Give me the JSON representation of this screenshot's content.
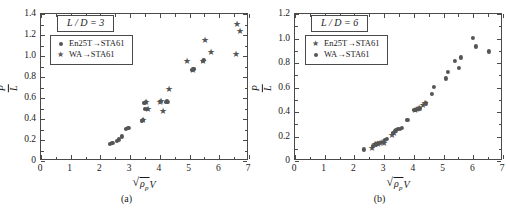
{
  "figure": {
    "panels": [
      {
        "id": "a",
        "caption": "(a)",
        "title": "L / D = 3",
        "legend": [
          {
            "marker": "circle",
            "label": "En25T→STA61"
          },
          {
            "marker": "star",
            "label": "WA→STA61"
          }
        ],
        "axes": {
          "xlabel_parts": {
            "radical": "ρ",
            "sub": "p",
            "trailing": "V"
          },
          "ylabel_parts": {
            "numerator": "P",
            "denominator": "L"
          },
          "xticks": [
            0,
            1,
            2,
            3,
            4,
            5,
            6,
            7
          ],
          "yticks": [
            "0",
            "0.2",
            "0.4",
            "0.6",
            "0.8",
            "1.0",
            "1.2",
            "1.4"
          ]
        }
      },
      {
        "id": "b",
        "caption": "(b)",
        "title": "L / D = 6",
        "legend": [
          {
            "marker": "star",
            "label": "En25T→STA61"
          },
          {
            "marker": "circle",
            "label": "WA→STA61"
          }
        ],
        "axes": {
          "xlabel_parts": {
            "radical": "ρ",
            "sub": "p",
            "trailing": "V"
          },
          "ylabel_parts": {
            "numerator": "P",
            "denominator": "L"
          },
          "xticks": [
            0,
            1,
            2,
            3,
            4,
            5,
            6,
            7
          ],
          "yticks": [
            "0",
            "0.2",
            "0.4",
            "0.6",
            "0.8",
            "1.0",
            "1.2"
          ]
        }
      }
    ]
  },
  "chart_data": [
    {
      "type": "scatter",
      "panel": "a",
      "title": "L / D = 3",
      "xlabel": "sqrt(rho_p) V",
      "ylabel": "P / L",
      "xlim": [
        0,
        7
      ],
      "ylim": [
        0,
        1.4
      ],
      "xticks": [
        0,
        1,
        2,
        3,
        4,
        5,
        6,
        7
      ],
      "yticks": [
        0,
        0.2,
        0.4,
        0.6,
        0.8,
        1.0,
        1.2,
        1.4
      ],
      "grid": false,
      "legend_position": "upper-left",
      "series": [
        {
          "name": "En25T→STA61",
          "marker": "circle",
          "points": [
            [
              2.33,
              0.165
            ],
            [
              2.4,
              0.17
            ],
            [
              2.55,
              0.195
            ],
            [
              2.62,
              0.205
            ],
            [
              2.72,
              0.235
            ],
            [
              2.86,
              0.305
            ],
            [
              2.94,
              0.315
            ],
            [
              3.4,
              0.385
            ],
            [
              3.44,
              0.395
            ],
            [
              3.48,
              0.555
            ],
            [
              3.52,
              0.56
            ],
            [
              3.5,
              0.5
            ],
            [
              3.56,
              0.495
            ],
            [
              4.22,
              0.56
            ],
            [
              4.25,
              0.57
            ],
            [
              4.28,
              0.565
            ],
            [
              5.08,
              0.865
            ],
            [
              5.13,
              0.875
            ],
            [
              5.15,
              0.88
            ],
            [
              5.45,
              0.955
            ],
            [
              5.48,
              0.96
            ]
          ]
        },
        {
          "name": "WA→STA61",
          "marker": "star",
          "points": [
            [
              3.44,
              0.395
            ],
            [
              3.52,
              0.56
            ],
            [
              3.6,
              0.495
            ],
            [
              4.02,
              0.565
            ],
            [
              4.05,
              0.57
            ],
            [
              4.12,
              0.48
            ],
            [
              4.32,
              0.685
            ],
            [
              4.9,
              0.95
            ],
            [
              5.12,
              0.87
            ],
            [
              5.46,
              0.955
            ],
            [
              5.52,
              1.15
            ],
            [
              5.72,
              1.04
            ],
            [
              6.55,
              1.02
            ],
            [
              6.58,
              1.305
            ],
            [
              6.7,
              1.24
            ]
          ]
        }
      ]
    },
    {
      "type": "scatter",
      "panel": "b",
      "title": "L / D = 6",
      "xlabel": "sqrt(rho_p) V",
      "ylabel": "P / L",
      "xlim": [
        0,
        7
      ],
      "ylim": [
        0,
        1.2
      ],
      "xticks": [
        0,
        1,
        2,
        3,
        4,
        5,
        6,
        7
      ],
      "yticks": [
        0,
        0.2,
        0.4,
        0.6,
        0.8,
        1.0,
        1.2
      ],
      "grid": false,
      "legend_position": "upper-left",
      "series": [
        {
          "name": "En25T→STA61",
          "marker": "star",
          "points": [
            [
              2.58,
              0.105
            ],
            [
              2.7,
              0.135
            ],
            [
              2.78,
              0.14
            ],
            [
              2.86,
              0.145
            ],
            [
              2.92,
              0.155
            ],
            [
              2.98,
              0.15
            ],
            [
              3.26,
              0.215
            ],
            [
              3.32,
              0.23
            ],
            [
              4.05,
              0.42
            ],
            [
              4.12,
              0.425
            ],
            [
              4.18,
              0.43
            ],
            [
              4.3,
              0.455
            ],
            [
              4.36,
              0.475
            ]
          ]
        },
        {
          "name": "WA→STA61",
          "marker": "circle",
          "points": [
            [
              2.33,
              0.095
            ],
            [
              2.62,
              0.125
            ],
            [
              2.72,
              0.135
            ],
            [
              2.8,
              0.145
            ],
            [
              3.02,
              0.17
            ],
            [
              3.1,
              0.18
            ],
            [
              3.3,
              0.23
            ],
            [
              3.36,
              0.245
            ],
            [
              3.4,
              0.25
            ],
            [
              3.46,
              0.265
            ],
            [
              3.52,
              0.265
            ],
            [
              3.6,
              0.27
            ],
            [
              3.78,
              0.335
            ],
            [
              4.02,
              0.415
            ],
            [
              4.08,
              0.42
            ],
            [
              4.14,
              0.425
            ],
            [
              4.2,
              0.43
            ],
            [
              4.4,
              0.47
            ],
            [
              4.62,
              0.545
            ],
            [
              4.68,
              0.605
            ],
            [
              5.08,
              0.675
            ],
            [
              5.14,
              0.73
            ],
            [
              5.38,
              0.815
            ],
            [
              5.52,
              0.76
            ],
            [
              5.58,
              0.845
            ],
            [
              5.98,
              1.005
            ],
            [
              6.1,
              0.935
            ],
            [
              6.52,
              0.895
            ]
          ]
        }
      ]
    }
  ]
}
